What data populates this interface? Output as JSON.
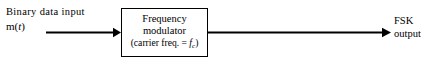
{
  "diagram": {
    "type": "block-diagram",
    "background_color": "#ffffff",
    "line_color": "#000000",
    "input": {
      "label_line1": "Binary data input",
      "signal_expression_prefix": "m(",
      "signal_expression_var": "t",
      "signal_expression_suffix": ")",
      "arrow_name": "input-arrow"
    },
    "block": {
      "line1": "Frequency",
      "line2": "modulator",
      "line3_prefix": "(carrier freq. = ",
      "line3_symbol": "f",
      "line3_subscript": "c",
      "line3_suffix": ")"
    },
    "output": {
      "label_line1": "FSK",
      "label_line2": "output",
      "arrow_name": "output-arrow"
    }
  }
}
